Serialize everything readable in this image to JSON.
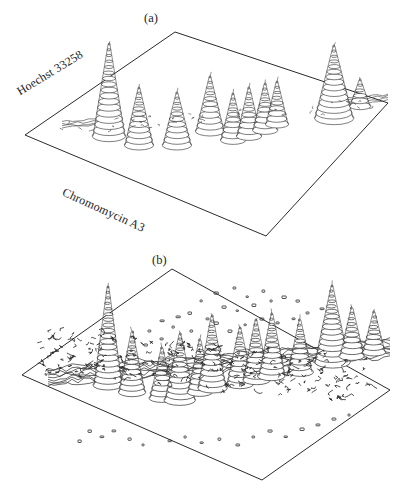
{
  "figure": {
    "type": "bivariate-flow-karyotype",
    "panels": [
      {
        "id": "a",
        "label": "(a)",
        "axes": {
          "left_label": "Hoechst 33258",
          "bottom_label": "Chromomycin A3"
        }
      },
      {
        "id": "b",
        "label": "(b)",
        "axes": {
          "left_label": "Hoechst 33258",
          "bottom_label": "Chromomycin A3"
        }
      }
    ]
  },
  "chart_data": {
    "type": "surface",
    "title": "",
    "subtitle": "",
    "xlabel": "Chromomycin A3",
    "ylabel": "Hoechst 33258",
    "zlabel": "",
    "grid": false,
    "legend": "none",
    "projection": "isometric-wireframe",
    "render_style": "stacked contour rings (cone peaks) on parallelogram base plane",
    "stroke_color": "#2b2b2b",
    "fill_color": "#ffffff",
    "panels": [
      {
        "id": "a",
        "label": "(a)",
        "noise_level": "low",
        "baseline_clutter": "sparse low ridges near left and right edges",
        "base_plane_corners": {
          "top": [
            175,
            32
          ],
          "right": [
            388,
            103
          ],
          "bottom": [
            266,
            236
          ],
          "left": [
            25,
            135
          ]
        },
        "peaks": [
          {
            "name": "peak-a1",
            "cx": 109,
            "base_y": 136,
            "height": 92,
            "radius": 16,
            "rings": 17
          },
          {
            "name": "peak-a2",
            "cx": 139,
            "base_y": 145,
            "height": 57,
            "radius": 14,
            "rings": 12
          },
          {
            "name": "peak-a3",
            "cx": 177,
            "base_y": 145,
            "height": 52,
            "radius": 14,
            "rings": 11
          },
          {
            "name": "peak-a4",
            "cx": 210,
            "base_y": 131,
            "height": 54,
            "radius": 14,
            "rings": 11
          },
          {
            "name": "peak-a5",
            "cx": 233,
            "base_y": 140,
            "height": 46,
            "radius": 12,
            "rings": 10
          },
          {
            "name": "peak-a6",
            "cx": 249,
            "base_y": 136,
            "height": 48,
            "radius": 12,
            "rings": 10
          },
          {
            "name": "peak-a7",
            "cx": 265,
            "base_y": 130,
            "height": 46,
            "radius": 12,
            "rings": 10
          },
          {
            "name": "peak-a8",
            "cx": 277,
            "base_y": 124,
            "height": 42,
            "radius": 11,
            "rings": 9
          },
          {
            "name": "peak-a9",
            "cx": 334,
            "base_y": 118,
            "height": 72,
            "radius": 19,
            "rings": 15
          },
          {
            "name": "peak-a10",
            "cx": 360,
            "base_y": 106,
            "height": 26,
            "radius": 10,
            "rings": 6
          }
        ],
        "ridges": [
          {
            "name": "ridge-a-left",
            "x0": 62,
            "x1": 104,
            "y": 128,
            "height": 13
          },
          {
            "name": "ridge-a-right",
            "x0": 346,
            "x1": 388,
            "y": 104,
            "height": 12
          }
        ],
        "values_note": "peak heights in px above local base line; z axis unlabeled"
      },
      {
        "id": "b",
        "label": "(b)",
        "noise_level": "high",
        "baseline_clutter": "dense contour noise across full baseline plus scattered isolated speckles above plane",
        "base_plane_corners": {
          "top": [
            172,
            269
          ],
          "right": [
            390,
            390
          ],
          "bottom": [
            262,
            480
          ],
          "left": [
            22,
            375
          ]
        },
        "peaks": [
          {
            "name": "peak-b1",
            "cx": 108,
            "base_y": 385,
            "height": 98,
            "radius": 14,
            "rings": 19
          },
          {
            "name": "peak-b2",
            "cx": 132,
            "base_y": 392,
            "height": 60,
            "radius": 13,
            "rings": 13
          },
          {
            "name": "peak-b3",
            "cx": 162,
            "base_y": 398,
            "height": 50,
            "radius": 12,
            "rings": 11
          },
          {
            "name": "peak-b4",
            "cx": 180,
            "base_y": 400,
            "height": 66,
            "radius": 15,
            "rings": 14
          },
          {
            "name": "peak-b5",
            "cx": 200,
            "base_y": 392,
            "height": 52,
            "radius": 12,
            "rings": 11
          },
          {
            "name": "peak-b6",
            "cx": 212,
            "base_y": 388,
            "height": 72,
            "radius": 14,
            "rings": 15
          },
          {
            "name": "peak-b7",
            "cx": 240,
            "base_y": 384,
            "height": 56,
            "radius": 13,
            "rings": 12
          },
          {
            "name": "peak-b8",
            "cx": 256,
            "base_y": 380,
            "height": 60,
            "radius": 13,
            "rings": 13
          },
          {
            "name": "peak-b9",
            "cx": 272,
            "base_y": 376,
            "height": 62,
            "radius": 13,
            "rings": 13
          },
          {
            "name": "peak-b10",
            "cx": 300,
            "base_y": 372,
            "height": 52,
            "radius": 12,
            "rings": 11
          },
          {
            "name": "peak-b11",
            "cx": 332,
            "base_y": 362,
            "height": 76,
            "radius": 17,
            "rings": 16
          },
          {
            "name": "peak-b12",
            "cx": 352,
            "base_y": 356,
            "height": 48,
            "radius": 12,
            "rings": 10
          },
          {
            "name": "peak-b13",
            "cx": 374,
            "base_y": 352,
            "height": 40,
            "radius": 11,
            "rings": 9
          }
        ],
        "ridges": [
          {
            "name": "ridge-b-baseline",
            "x0": 48,
            "x1": 390,
            "y": 386,
            "height": 18
          }
        ],
        "speckles": [
          [
            200,
            300
          ],
          [
            214,
            292
          ],
          [
            233,
            287
          ],
          [
            246,
            296
          ],
          [
            262,
            290
          ],
          [
            222,
            306
          ],
          [
            236,
            310
          ],
          [
            188,
            312
          ],
          [
            176,
            316
          ],
          [
            206,
            318
          ],
          [
            252,
            304
          ],
          [
            270,
            300
          ],
          [
            282,
            296
          ],
          [
            296,
            300
          ],
          [
            172,
            326
          ],
          [
            190,
            330
          ],
          [
            160,
            320
          ],
          [
            148,
            330
          ],
          [
            214,
            322
          ],
          [
            228,
            330
          ],
          [
            244,
            324
          ],
          [
            260,
            318
          ],
          [
            276,
            322
          ],
          [
            292,
            318
          ],
          [
            306,
            312
          ],
          [
            320,
            308
          ],
          [
            160,
            338
          ],
          [
            144,
            344
          ],
          [
            130,
            350
          ],
          [
            118,
            356
          ],
          [
            88,
            430
          ],
          [
            100,
            436
          ],
          [
            112,
            430
          ],
          [
            78,
            440
          ],
          [
            128,
            438
          ],
          [
            142,
            444
          ],
          [
            168,
            440
          ],
          [
            184,
            436
          ],
          [
            200,
            442
          ],
          [
            218,
            438
          ],
          [
            236,
            444
          ],
          [
            252,
            436
          ],
          [
            268,
            430
          ],
          [
            284,
            436
          ],
          [
            300,
            428
          ],
          [
            316,
            424
          ],
          [
            332,
            418
          ],
          [
            348,
            414
          ]
        ],
        "values_note": "panel (b) shows the same karyotype with substantially higher background noise"
      }
    ]
  }
}
